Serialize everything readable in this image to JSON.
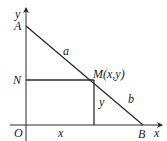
{
  "figure": {
    "type": "geometry-diagram",
    "colors": {
      "stroke": "#2a2a2a",
      "text": "#1a1a1a",
      "background": "#ffffff"
    },
    "axes": {
      "x_label": "x",
      "y_label": "y",
      "origin_label": "O"
    },
    "points": {
      "A": {
        "label": "A",
        "px": [
          26,
          26
        ]
      },
      "B": {
        "label": "B",
        "px": [
          143,
          125
        ]
      },
      "M": {
        "label": "M(x,y)",
        "px": [
          94,
          80
        ]
      },
      "N": {
        "label": "N",
        "px": [
          26,
          80
        ]
      },
      "O": {
        "label": "O",
        "px": [
          26,
          125
        ]
      }
    },
    "segment_labels": {
      "AM": "a",
      "MB": "b",
      "M_to_x_axis": "y",
      "O_to_foot": "x"
    }
  }
}
